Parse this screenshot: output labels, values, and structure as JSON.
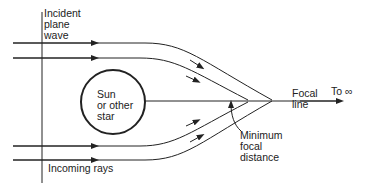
{
  "diagram": {
    "labels": {
      "incident": "Incident\nplane\nwave",
      "sun": "Sun\nor other\nstar",
      "focal_line": "Focal\nline",
      "to_infinity": "To ∞",
      "min_focal": "Minimum\nfocal\ndistance",
      "incoming": "Incoming rays"
    },
    "colors": {
      "stroke": "#222222",
      "background": "#ffffff"
    }
  }
}
